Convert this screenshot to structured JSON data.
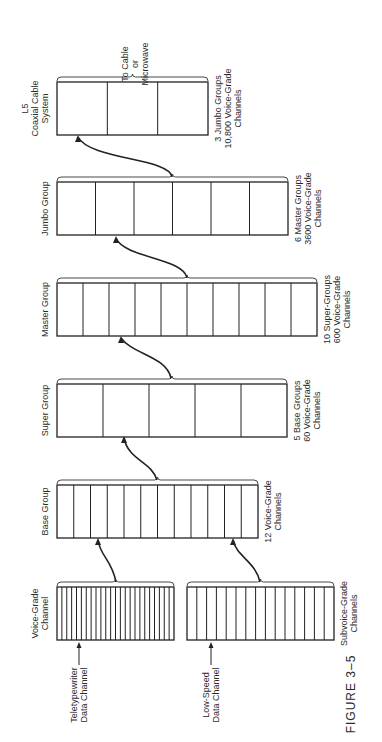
{
  "figure": {
    "caption": "FIGURE 3–5",
    "orientation": "rotated 90° counter-clockwise"
  },
  "stages": [
    {
      "id": "voice-grade",
      "title_lines": [
        "Voice-Grade",
        "Channel"
      ],
      "cells": 24,
      "note_lines": [],
      "pointer_lines": [
        "Teletypewriter",
        "Data Channel"
      ]
    },
    {
      "id": "subvoice-grade",
      "title_lines": [],
      "cells": 15,
      "note_lines": [
        "Subvoice-Grade",
        "Channels"
      ],
      "pointer_lines": [
        "Low-Speed",
        "Data Channel"
      ]
    },
    {
      "id": "base-group",
      "title_lines": [
        "Base Group"
      ],
      "cells": 12,
      "note_lines": [
        "12 Voice-Grade",
        "Channels"
      ]
    },
    {
      "id": "super-group",
      "title_lines": [
        "Super Group"
      ],
      "cells": 5,
      "note_lines": [
        "5 Base Groups",
        "60 Voice-Grade",
        "Channels"
      ]
    },
    {
      "id": "master-group",
      "title_lines": [
        "Master Group"
      ],
      "cells": 10,
      "note_lines": [
        "10 Super-Groups",
        "600 Voice-Grade",
        "Channels"
      ]
    },
    {
      "id": "jumbo-group",
      "title_lines": [
        "Jumbo Group"
      ],
      "cells": 6,
      "note_lines": [
        "6 Master Groups",
        "3600 Voice-Grade",
        "Channels"
      ]
    },
    {
      "id": "l5-system",
      "title_lines": [
        "L5",
        "Coaxial Cable",
        "System"
      ],
      "cells": 3,
      "note_lines": [
        "3 Jumbo Groups",
        "10,800 Voice-Grade",
        "Channels"
      ],
      "output_lines": [
        "To Cable",
        "or",
        "Microwave"
      ]
    }
  ],
  "colors": {
    "line": "#222222",
    "background": "#ffffff",
    "text": "#2a2a2a"
  }
}
